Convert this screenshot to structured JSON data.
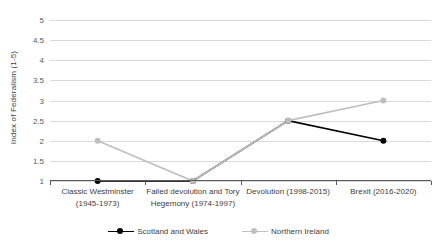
{
  "chart_data": {
    "type": "line",
    "title": "",
    "xlabel": "",
    "ylabel": "Index of Federalism (1-5)",
    "ylim": [
      1,
      5
    ],
    "yticks": [
      1,
      1.5,
      2,
      2.5,
      3,
      3.5,
      4,
      4.5,
      5
    ],
    "ytick_labels": [
      "1",
      "1.5",
      "2",
      "2.5",
      "3",
      "3.5",
      "4",
      "4.5",
      "5"
    ],
    "grid": true,
    "legend_position": "bottom",
    "categories": [
      "Classic Westminster (1945-1973)",
      "Failed devolution and Tory Hegemony (1974-1997)",
      "Devolution (1998-2015)",
      "Brexit (2016-2020)"
    ],
    "category_lines": [
      [
        "Classic Westminster",
        "(1945-1973)"
      ],
      [
        "Failed devolution and Tory",
        "Hegemony (1974-1997)"
      ],
      [
        "Devolution (1998-2015)",
        ""
      ],
      [
        "Brexit (2016-2020)",
        ""
      ]
    ],
    "series": [
      {
        "name": "Scotland and Wales",
        "color": "#000000",
        "marker": "circle",
        "values": [
          1,
          1,
          2.5,
          2
        ]
      },
      {
        "name": "Northern Ireland",
        "color": "#BFBFBF",
        "marker": "circle",
        "values": [
          2,
          1,
          2.5,
          3
        ]
      }
    ]
  },
  "colors": {
    "background": "#FFFFFF",
    "gridline": "#D9D9D9",
    "axis": "#595959",
    "tick_text": "#595959",
    "label_text": "#404040"
  }
}
